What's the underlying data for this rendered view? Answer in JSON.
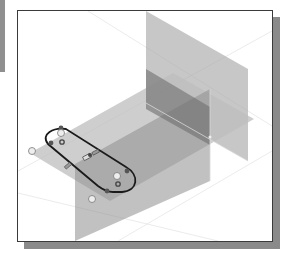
{
  "viewport": {
    "view": "isometric",
    "background": "#ffffff",
    "border_color": "#3a3a3a",
    "shadow_color": "#8a8a8a"
  },
  "planes": [
    {
      "name": "XY-plane",
      "color": "#b8b8b8",
      "opacity": 0.75
    },
    {
      "name": "YZ-plane",
      "color": "#8c8c8c",
      "opacity": 0.7
    },
    {
      "name": "XZ-plane",
      "color": "#9a9a9a",
      "opacity": 0.6
    }
  ],
  "sketch": {
    "shape": "slot",
    "stroke": "#1a1a1a",
    "constraint_glyphs": [
      "tangent",
      "tangent",
      "tangent",
      "tangent",
      "parallel",
      "parallel",
      "equal",
      "coincident",
      "center-point",
      "center-point"
    ]
  },
  "colors": {
    "side_bar": "#8f8f8f",
    "axis_lines": "#e8e8e8"
  }
}
